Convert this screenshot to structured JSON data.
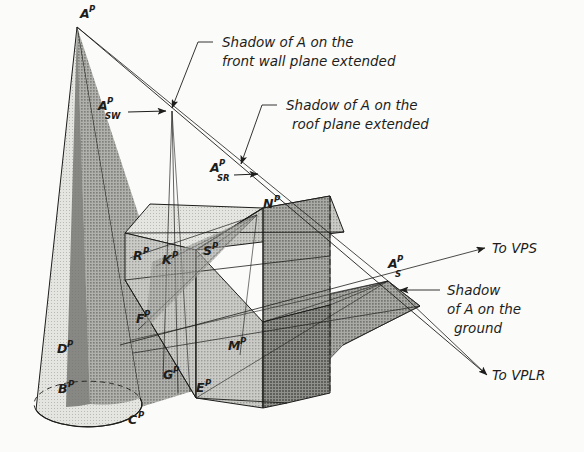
{
  "figure": {
    "background_color": "#fbfbf9",
    "ink_color": "#1d1d1b"
  },
  "annotations": [
    {
      "id": "ann-wall",
      "line1": "Shadow of A on the",
      "line2": "front wall plane extended"
    },
    {
      "id": "ann-roof",
      "line1": "Shadow of A on the",
      "line2": "roof plane extended"
    },
    {
      "id": "ann-ground",
      "line1": "Shadow",
      "line2": "of A on the",
      "line3": "ground"
    }
  ],
  "direction_labels": [
    {
      "id": "to-vps",
      "text": "To VPS"
    },
    {
      "id": "to-vplr",
      "text": "To VPLR"
    }
  ],
  "point_labels": [
    {
      "id": "A-P",
      "base": "A",
      "sup": "P",
      "sub": "",
      "x": 80,
      "y": 18
    },
    {
      "id": "A-P-SW",
      "base": "A",
      "sup": "P",
      "sub": "SW",
      "x": 98,
      "y": 110
    },
    {
      "id": "A-P-SR",
      "base": "A",
      "sup": "P",
      "sub": "SR",
      "x": 210,
      "y": 172
    },
    {
      "id": "A-P-S",
      "base": "A",
      "sup": "P",
      "sub": "S",
      "x": 388,
      "y": 268
    },
    {
      "id": "N-P",
      "base": "N",
      "sup": "P",
      "sub": "",
      "x": 263,
      "y": 208
    },
    {
      "id": "R-P",
      "base": "R",
      "sup": "P",
      "sub": "",
      "x": 133,
      "y": 260
    },
    {
      "id": "K-P",
      "base": "K",
      "sup": "P",
      "sub": "",
      "x": 162,
      "y": 264
    },
    {
      "id": "S-P",
      "base": "S",
      "sup": "P",
      "sub": "",
      "x": 203,
      "y": 255
    },
    {
      "id": "F-P",
      "base": "F",
      "sup": "P",
      "sub": "",
      "x": 136,
      "y": 323
    },
    {
      "id": "D-P",
      "base": "D",
      "sup": "P",
      "sub": "",
      "x": 57,
      "y": 353
    },
    {
      "id": "M-P",
      "base": "M",
      "sup": "P",
      "sub": "",
      "x": 228,
      "y": 350
    },
    {
      "id": "B-P",
      "base": "B",
      "sup": "P",
      "sub": "",
      "x": 58,
      "y": 393
    },
    {
      "id": "G-P",
      "base": "G",
      "sup": "P",
      "sub": "",
      "x": 163,
      "y": 379
    },
    {
      "id": "E-P",
      "base": "E",
      "sup": "P",
      "sub": "",
      "x": 196,
      "y": 392
    },
    {
      "id": "C-P",
      "base": "C",
      "sup": "P",
      "sub": "",
      "x": 128,
      "y": 424
    }
  ],
  "tones": {
    "cone_light": "#cfcfcc",
    "cone_dark": "#8e8e8b",
    "roof_light": "#dcdcd9",
    "roof_mid": "#bdbdba",
    "gable_dark": "#9a9a97",
    "wall_mid": "#b4b4b1",
    "ground_shadow": "#9d9d9a",
    "cone_shadow": "#8a8a87"
  }
}
